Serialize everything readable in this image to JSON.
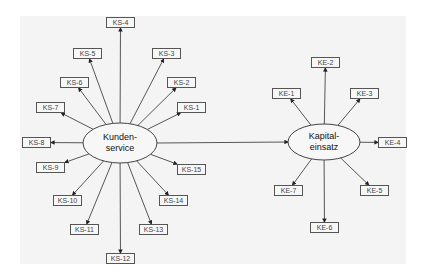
{
  "diagram": {
    "hubs": [
      {
        "id": "kundenservice",
        "line1": "Kunden-",
        "line2": "service",
        "cx": 120,
        "cy": 143,
        "rx": 37,
        "ry": 20
      },
      {
        "id": "kapitaleinsatz",
        "line1": "Kapital-",
        "line2": "einsatz",
        "cx": 324,
        "cy": 142,
        "rx": 36,
        "ry": 18
      }
    ],
    "connector": {
      "from": "kundenservice",
      "to": "kapitaleinsatz",
      "label": ""
    },
    "ks_nodes": [
      {
        "label": "KS-1",
        "x": 177,
        "y": 102
      },
      {
        "label": "KS-2",
        "x": 167,
        "y": 77
      },
      {
        "label": "KS-3",
        "x": 152,
        "y": 48
      },
      {
        "label": "KS-4",
        "x": 106,
        "y": 17
      },
      {
        "label": "KS-5",
        "x": 73,
        "y": 48
      },
      {
        "label": "KS-6",
        "x": 60,
        "y": 77
      },
      {
        "label": "KS-7",
        "x": 36,
        "y": 102
      },
      {
        "label": "KS-8",
        "x": 22,
        "y": 137
      },
      {
        "label": "KS-9",
        "x": 36,
        "y": 162
      },
      {
        "label": "KS-10",
        "x": 53,
        "y": 195
      },
      {
        "label": "KS-11",
        "x": 70,
        "y": 224
      },
      {
        "label": "KS-12",
        "x": 106,
        "y": 253
      },
      {
        "label": "KS-13",
        "x": 139,
        "y": 224
      },
      {
        "label": "KS-14",
        "x": 159,
        "y": 195
      },
      {
        "label": "KS-15",
        "x": 177,
        "y": 164
      }
    ],
    "ke_nodes": [
      {
        "label": "KE-1",
        "x": 272,
        "y": 88
      },
      {
        "label": "KE-2",
        "x": 311,
        "y": 57
      },
      {
        "label": "KE-3",
        "x": 350,
        "y": 88
      },
      {
        "label": "KE-4",
        "x": 378,
        "y": 137
      },
      {
        "label": "KE-5",
        "x": 360,
        "y": 185
      },
      {
        "label": "KE-6",
        "x": 310,
        "y": 222
      },
      {
        "label": "KE-7",
        "x": 274,
        "y": 185
      }
    ]
  },
  "colors": {
    "panel": "#f4f4f4",
    "line": "#444444",
    "box_border": "#555555",
    "text": "#444444"
  }
}
